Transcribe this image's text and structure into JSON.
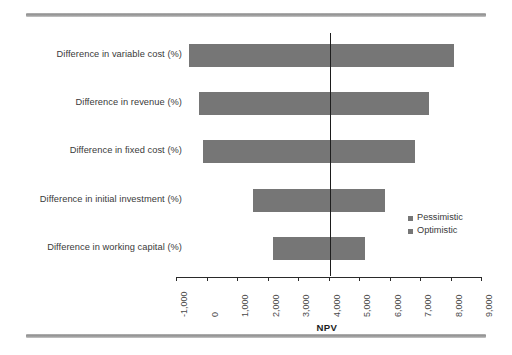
{
  "chart_data": {
    "type": "bar",
    "subtype": "tornado",
    "title": "",
    "xlabel": "NPV",
    "ylabel": "",
    "categories": [
      "Difference in variable cost (%)",
      "Difference in revenue (%)",
      "Difference in fixed cost (%)",
      "Difference in initial investment (%)",
      "Difference in working capital (%)"
    ],
    "series": [
      {
        "name": "Pessimistic",
        "values": [
          -570,
          -250,
          -110,
          1530,
          2180
        ]
      },
      {
        "name": "Optimistic",
        "values": [
          8100,
          7300,
          6840,
          5860,
          5200
        ]
      }
    ],
    "bars": [
      {
        "category": "Difference in variable cost (%)",
        "low": -570,
        "high": 8100
      },
      {
        "category": "Difference in revenue (%)",
        "low": -250,
        "high": 7300
      },
      {
        "category": "Difference in fixed cost (%)",
        "low": -110,
        "high": 6840
      },
      {
        "category": "Difference in initial investment (%)",
        "low": 1530,
        "high": 5860
      },
      {
        "category": "Difference in working capital (%)",
        "low": 2180,
        "high": 5200
      }
    ],
    "base_case_line": 4050,
    "xlim": [
      -1000,
      9000
    ],
    "xticks": [
      -1000,
      0,
      1000,
      2000,
      3000,
      4000,
      5000,
      6000,
      7000,
      8000,
      9000
    ],
    "xtick_labels": [
      "-1,000",
      "0",
      "1,000",
      "2,000",
      "3,000",
      "4,000",
      "5,000",
      "6,000",
      "7,000",
      "8,000",
      "9,000"
    ],
    "grid": false,
    "legend": {
      "position": "right-middle",
      "entries": [
        {
          "label": "Pessimistic",
          "color": "#767676"
        },
        {
          "label": "Optimistic",
          "color": "#767676"
        }
      ]
    },
    "colors": {
      "bar": "#767676",
      "baseline": "#1d1d1d",
      "axis": "#2a2a2a",
      "text": "#3a3a3a",
      "rule": "#9a9a9a",
      "background": "#ffffff"
    }
  },
  "decor": {
    "top_rule": "",
    "bottom_rule": ""
  }
}
